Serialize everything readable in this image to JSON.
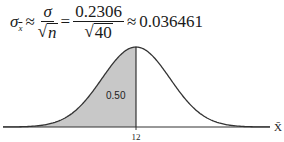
{
  "formula": {
    "lhs_symbol": "σ",
    "lhs_subscript": "x",
    "approx1": "≈",
    "frac1_num": "σ",
    "frac1_den_var": "n",
    "equals": "=",
    "frac2_num": "0.2306",
    "frac2_den_value": "40",
    "approx2": "≈",
    "result": "0.036461"
  },
  "chart_data": {
    "type": "area",
    "title": "",
    "mean": 12,
    "standard_error": 0.036461,
    "shaded_region": "left of mean",
    "shaded_area_label": "0.50",
    "shaded_area": 0.5,
    "x_tick_labels": [
      "12"
    ],
    "xlabel": "X̄",
    "ylabel": "",
    "grid": false,
    "legend": false,
    "colors": {
      "shade": "#c8c8c8",
      "curve": "#333333",
      "axis": "#333333"
    }
  },
  "labels": {
    "shaded_area": "0.50",
    "mean_tick": "12",
    "x_axis": "X̄"
  }
}
